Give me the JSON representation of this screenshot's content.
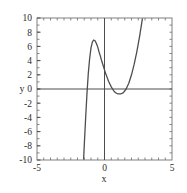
{
  "chart_data": {
    "type": "line",
    "title": "",
    "xlabel": "x",
    "ylabel": "y",
    "xlim": [
      -5,
      5
    ],
    "ylim": [
      -10,
      10
    ],
    "grid": false,
    "legend": null,
    "x_ticks": [
      -5,
      0,
      5
    ],
    "x_tick_labels": [
      "-5",
      "0",
      "5"
    ],
    "y_ticks": [
      -10,
      -8,
      -6,
      -4,
      -2,
      0,
      2,
      4,
      6,
      8,
      10
    ],
    "y_tick_labels": [
      "-10",
      "-8",
      "-6",
      "-4",
      "-2",
      "0",
      "2",
      "4",
      "6",
      "8",
      "10"
    ],
    "minor_tick_step_x": 0.5,
    "axis_lines": {
      "x_axis_at_y": 0,
      "y_axis_at_x": 0
    },
    "curve_color": "#4d4d4d",
    "frame_color": "#808080",
    "series": [
      {
        "name": "cubic",
        "expression": "y = x^3 - 7x + 5",
        "local_maximum": {
          "x": 0.0,
          "y": 5.0
        },
        "local_minimum": {
          "x": 2.8,
          "y": -4.7
        },
        "roots": [
          -1.1,
          1.0,
          3.8
        ],
        "x": [
          -1.55,
          -1.5,
          -1.4,
          -1.3,
          -1.2,
          -1.1,
          -1.0,
          -0.9,
          -0.8,
          -0.7,
          -0.6,
          -0.5,
          -0.4,
          -0.3,
          -0.2,
          -0.1,
          0.0,
          0.1,
          0.2,
          0.3,
          0.4,
          0.5,
          0.6,
          0.7,
          0.8,
          0.9,
          1.0,
          1.2,
          1.4,
          1.6,
          1.8,
          2.0,
          2.2,
          2.4,
          2.6,
          2.8,
          3.0,
          3.2,
          3.4,
          3.6,
          3.8,
          4.0,
          4.2,
          4.4,
          4.55
        ],
        "y": [
          -10.0,
          -8.0,
          -4.2,
          -0.7,
          2.2,
          4.3,
          5.8,
          6.6,
          6.9,
          6.8,
          6.4,
          5.9,
          5.2,
          4.6,
          3.9,
          3.3,
          2.7,
          2.1,
          1.6,
          1.1,
          0.7,
          0.3,
          0.0,
          -0.3,
          -0.5,
          -0.6,
          -0.7,
          -0.7,
          -0.5,
          0.0,
          0.8,
          2.0,
          3.5,
          5.3,
          7.4,
          9.8,
          12.5,
          15.5,
          18.8,
          22.5,
          26.5,
          30.8,
          35.5,
          40.5,
          44.2
        ]
      }
    ]
  },
  "axis_labels": {
    "x_title": "x",
    "y_title": "y"
  }
}
